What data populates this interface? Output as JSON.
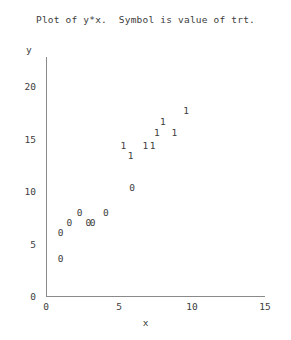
{
  "chart_data": {
    "type": "scatter",
    "title": "Plot of y*x.  Symbol is value of trt.",
    "xlabel": "x",
    "ylabel": "y",
    "xlim": [
      0,
      15
    ],
    "ylim": [
      0,
      20
    ],
    "xticks": [
      "0",
      "5",
      "10",
      "15"
    ],
    "xtick_values": [
      0,
      5,
      10,
      15
    ],
    "yticks": [
      "0",
      "5",
      "10",
      "15",
      "20"
    ],
    "ytick_values": [
      0,
      5,
      10,
      15,
      20
    ],
    "grid": false,
    "legend": false,
    "symbol_meaning": "Symbol is value of trt.",
    "series": [
      {
        "name": "0",
        "symbol": "0",
        "points": [
          {
            "x": 1.0,
            "y": 6.0
          },
          {
            "x": 1.0,
            "y": 3.5
          },
          {
            "x": 1.6,
            "y": 7.0
          },
          {
            "x": 2.3,
            "y": 7.9
          },
          {
            "x": 2.9,
            "y": 7.0
          },
          {
            "x": 3.2,
            "y": 7.0
          },
          {
            "x": 4.1,
            "y": 7.9
          },
          {
            "x": 5.9,
            "y": 10.3
          }
        ]
      },
      {
        "name": "1",
        "symbol": "1",
        "points": [
          {
            "x": 5.3,
            "y": 14.3
          },
          {
            "x": 5.8,
            "y": 13.3
          },
          {
            "x": 6.8,
            "y": 14.3
          },
          {
            "x": 7.3,
            "y": 14.3
          },
          {
            "x": 7.6,
            "y": 15.5
          },
          {
            "x": 8.0,
            "y": 16.6
          },
          {
            "x": 8.8,
            "y": 15.5
          },
          {
            "x": 9.6,
            "y": 17.6
          }
        ]
      }
    ]
  },
  "geometry": {
    "x_origin_px": 46,
    "y_origin_px": 296,
    "px_per_x_unit": 14.6,
    "px_per_y_unit": 10.5
  }
}
